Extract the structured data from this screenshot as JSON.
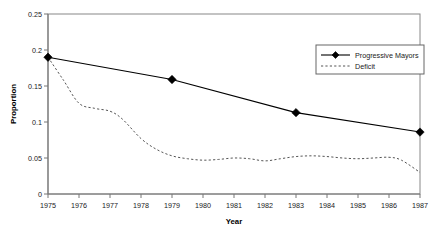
{
  "chart_data": {
    "type": "line",
    "title": "",
    "xlabel": "Year",
    "ylabel": "Proportion",
    "xlim": [
      1975,
      1987
    ],
    "ylim": [
      0,
      0.25
    ],
    "grid": false,
    "legend_position": "upper-right",
    "x_tick_labels": [
      "1975",
      "1976",
      "1977",
      "1978",
      "1979",
      "1980",
      "1981",
      "1982",
      "1983",
      "1984",
      "1985",
      "1986",
      "1987"
    ],
    "y_tick_labels": [
      "0",
      "0.05",
      "0.1",
      "0.15",
      "0.2",
      "0.25"
    ],
    "y_tick_values": [
      0,
      0.05,
      0.1,
      0.15,
      0.2,
      0.25
    ],
    "series": [
      {
        "name": "Progressive Mayors",
        "style": "solid-with-diamond-markers",
        "color": "#000000",
        "x": [
          1975,
          1979,
          1983,
          1987
        ],
        "values": [
          0.19,
          0.159,
          0.113,
          0.086
        ]
      },
      {
        "name": "Deficit",
        "style": "dashed",
        "color": "#555555",
        "x": [
          1975,
          1975.5,
          1976,
          1976.5,
          1977,
          1977.4,
          1978,
          1978.5,
          1979,
          1979.5,
          1980,
          1980.5,
          1981,
          1981.5,
          1982,
          1982.5,
          1983,
          1983.5,
          1984,
          1984.5,
          1985,
          1985.5,
          1986,
          1986.4,
          1987
        ],
        "values": [
          0.19,
          0.158,
          0.126,
          0.119,
          0.115,
          0.104,
          0.077,
          0.062,
          0.053,
          0.049,
          0.047,
          0.048,
          0.05,
          0.049,
          0.046,
          0.049,
          0.052,
          0.053,
          0.052,
          0.05,
          0.049,
          0.05,
          0.051,
          0.047,
          0.03
        ]
      }
    ]
  },
  "legend": {
    "items": [
      {
        "label": "Progressive Mayors"
      },
      {
        "label": "Deficit"
      }
    ]
  }
}
